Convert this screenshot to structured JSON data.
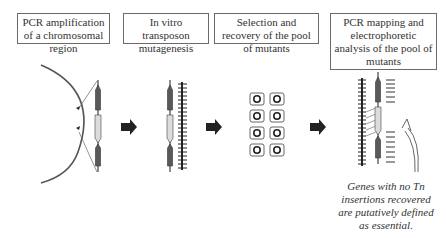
{
  "steps": [
    {
      "id": 1,
      "label": "PCR amplification of a chromosomal region"
    },
    {
      "id": 2,
      "label": "In vitro transposon mutagenesis"
    },
    {
      "id": 3,
      "label": "Selection and recovery of the pool of mutants"
    },
    {
      "id": 4,
      "label": "PCR mapping and electrophoretic analysis of the pool of mutants"
    }
  ],
  "note": "Genes with no Tn insertions recovered are putatively defined as essential.",
  "icons": {
    "flow_arrow": "right-block-arrow-icon",
    "chromosome": "chromosome-arc-icon",
    "dna_fragment": "pcr-fragment-icon",
    "transposon_insertions": "tn-insertions-icon",
    "colony_plates": "mutant-colony-well-icon",
    "gel_bands": "gel-bands-icon",
    "curved_arrow": "curved-arrow-icon"
  },
  "colors": {
    "dark_gene": "#555555",
    "light_gene": "#dcdcdc",
    "arrow": "#222222",
    "line": "#444444"
  }
}
